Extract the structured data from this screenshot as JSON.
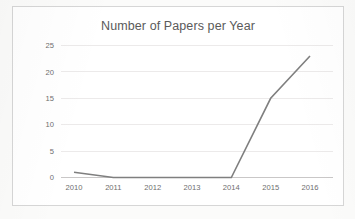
{
  "chart_data": {
    "type": "line",
    "title": "Number of Papers per Year",
    "xlabel": "",
    "ylabel": "",
    "categories": [
      "2010",
      "2011",
      "2012",
      "2013",
      "2014",
      "2015",
      "2016"
    ],
    "x": [
      2010,
      2011,
      2012,
      2013,
      2014,
      2015,
      2016
    ],
    "values": [
      1,
      0,
      0,
      0,
      0,
      15,
      23
    ],
    "series": [
      {
        "name": "Papers",
        "values": [
          1,
          0,
          0,
          0,
          0,
          15,
          23
        ]
      }
    ],
    "ylim": [
      0,
      25
    ],
    "y_ticks": [
      0,
      5,
      10,
      15,
      20,
      25
    ],
    "y_tick_labels": [
      "0",
      "5",
      "10",
      "15",
      "20",
      "25"
    ],
    "xlim": [
      2010,
      2016
    ],
    "grid": true,
    "grid_axis": "y",
    "legend": false,
    "legend_position": "none",
    "markers": false,
    "colors": {
      "line": "#7f7f7f",
      "grid": "#eceaea",
      "axis": "#c9c7c7",
      "title_text": "#5a5a5a",
      "tick_text": "#6e6e6e",
      "plot_background": "#ffffff",
      "figure_border": "#d6d6d6",
      "page_background": "#fbfbfa"
    }
  }
}
